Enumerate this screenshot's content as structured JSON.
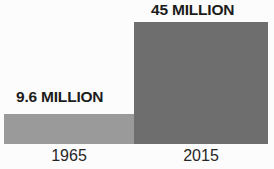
{
  "chart_data": {
    "type": "bar",
    "title": "",
    "subtitle": "",
    "xlabel": "",
    "ylabel": "",
    "categories": [
      "1965",
      "2015"
    ],
    "values": [
      9.6,
      45
    ],
    "units": "million",
    "data_labels": [
      "9.6 MILLION",
      "45 MILLION"
    ],
    "series": [
      {
        "name": "",
        "values": [
          9.6,
          45
        ]
      }
    ],
    "ylim": [
      0,
      45
    ],
    "grid": false,
    "axes_visible": false,
    "legend": false,
    "legend_position": "none",
    "bar_colors": [
      "#9a9a9a",
      "#6e6e6e"
    ],
    "background_color": "#fcfcfc",
    "label_color": "#1c1c1c",
    "category_label_color": "#262626"
  },
  "bars": [
    {
      "category": "1965",
      "value_label": "9.6 MILLION",
      "color": "#9a9a9a"
    },
    {
      "category": "2015",
      "value_label": "45 MILLION",
      "color": "#6e6e6e"
    }
  ]
}
